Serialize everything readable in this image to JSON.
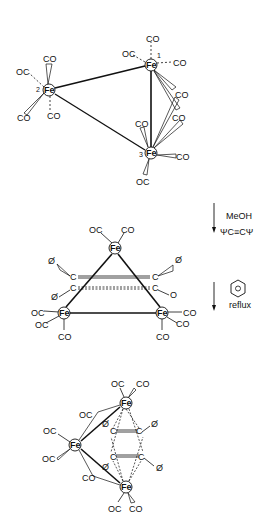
{
  "diagram": {
    "type": "reaction-scheme",
    "structures": [
      {
        "id": "triiron-dodecacarbonyl",
        "atoms": [
          {
            "label": "Fe",
            "number": "1",
            "x": 151,
            "y": 65
          },
          {
            "label": "Fe",
            "number": "2",
            "x": 49,
            "y": 90
          },
          {
            "label": "Fe",
            "number": "3",
            "x": 151,
            "y": 153
          }
        ],
        "ligands": [
          "CO",
          "OC",
          "CO",
          "CO",
          "CO",
          "OC",
          "CO",
          "CO",
          "CO",
          "CO",
          "CO",
          "OC"
        ]
      },
      {
        "id": "intermediate-alkyne-complex",
        "atoms": [
          {
            "label": "Fe",
            "x": 115,
            "y": 248
          },
          {
            "label": "Fe",
            "x": 64,
            "y": 313
          },
          {
            "label": "Fe",
            "x": 162,
            "y": 313
          },
          {
            "label": "C",
            "x": 73,
            "y": 277
          },
          {
            "label": "C",
            "x": 73,
            "y": 288
          },
          {
            "label": "C",
            "x": 154,
            "y": 277
          },
          {
            "label": "C",
            "x": 154,
            "y": 288
          }
        ],
        "substituents": [
          "Ø",
          "Ø",
          "Ø",
          "O"
        ]
      },
      {
        "id": "ferrole-product",
        "atoms": [
          {
            "label": "Fe",
            "x": 126,
            "y": 403
          },
          {
            "label": "Fe",
            "x": 75,
            "y": 445
          },
          {
            "label": "Fe",
            "x": 126,
            "y": 487
          },
          {
            "label": "C",
            "x": 113,
            "y": 432
          },
          {
            "label": "C",
            "x": 139,
            "y": 432
          },
          {
            "label": "C",
            "x": 113,
            "y": 457
          },
          {
            "label": "C",
            "x": 141,
            "y": 457
          }
        ],
        "substituents": [
          "Ø",
          "Ø",
          "Ø",
          "Ø"
        ]
      }
    ],
    "steps": [
      {
        "reagents": [
          "MeOH",
          "ΨC≡CΨ"
        ]
      },
      {
        "reagents": [
          "benzene",
          "reflux"
        ]
      }
    ]
  },
  "labels": {
    "fe": "Fe",
    "co": "CO",
    "oc": "OC",
    "c": "C",
    "phi": "Ø",
    "o": "O",
    "n1": "1",
    "n2": "2",
    "n3": "3",
    "meoh": "MeOH",
    "alkyne": "ΨC≡CΨ",
    "reflux": "reflux",
    "benzene_inner": "O"
  }
}
